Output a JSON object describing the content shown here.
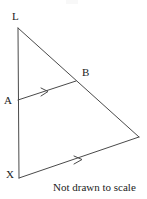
{
  "figure": {
    "caption": "Not drawn to scale",
    "stroke_color": "#4a4a4a",
    "label_color": "#1c1c1c",
    "background_color": "#ffffff",
    "stroke_width": 1,
    "labels": {
      "apex": "L",
      "left_point": "A",
      "bottom_left": "X",
      "right_point": "B"
    },
    "points": {
      "L": {
        "x": 18,
        "y": 28
      },
      "A": {
        "x": 18,
        "y": 100
      },
      "X": {
        "x": 19,
        "y": 178
      },
      "B": {
        "x": 76,
        "y": 81
      },
      "C": {
        "x": 139,
        "y": 137
      }
    },
    "segments": [
      {
        "name": "LX",
        "from": "L",
        "to": "X",
        "marker": "none"
      },
      {
        "name": "LC",
        "from": "L",
        "to": "C",
        "marker": "none"
      },
      {
        "name": "XC",
        "from": "X",
        "to": "C",
        "marker": "single-arrow"
      },
      {
        "name": "AB",
        "from": "A",
        "to": "B",
        "marker": "single-arrow"
      }
    ],
    "markers": {
      "ab_arrow": {
        "x": 45,
        "y": 92,
        "type": "parallel-arrow"
      },
      "xc_arrow": {
        "x": 78,
        "y": 160,
        "type": "parallel-arrow"
      }
    }
  }
}
